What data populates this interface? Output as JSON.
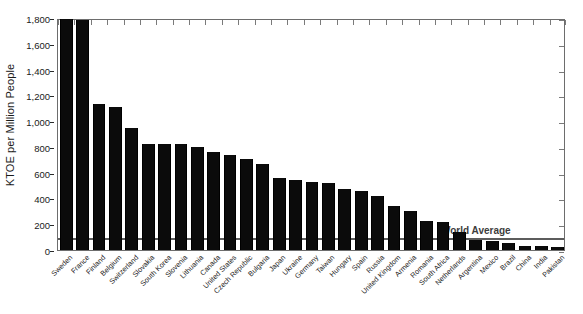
{
  "chart_data": {
    "type": "bar",
    "title": "",
    "xlabel": "",
    "ylabel": "KTOE per Million People",
    "ylim": [
      0,
      1800
    ],
    "ytick_labels": [
      "0",
      "200",
      "400",
      "600",
      "800",
      "1,000",
      "1,200",
      "1,400",
      "1,600",
      "1,800"
    ],
    "ytick_values": [
      0,
      200,
      400,
      600,
      800,
      1000,
      1200,
      1400,
      1600,
      1800
    ],
    "grid": false,
    "legend": "none",
    "bar_color": "#0b0b0b",
    "annotation": {
      "label": "World Average",
      "value": 100,
      "line_color": "#5c5c5c"
    },
    "categories": [
      "Sweden",
      "France",
      "Finland",
      "Belgium",
      "Switzerland",
      "Slovakia",
      "South Korea",
      "Slovenia",
      "Lithuania",
      "Canada",
      "United States",
      "Czech Republic",
      "Bulgaria",
      "Japan",
      "Ukraine",
      "Germany",
      "Taiwan",
      "Hungary",
      "Spain",
      "Russia",
      "United Kingdom",
      "Armenia",
      "Romania",
      "South Africa",
      "Netherlands",
      "Argentina",
      "Mexico",
      "Brazil",
      "China",
      "India",
      "Pakistan"
    ],
    "values": [
      1795,
      1785,
      1130,
      1110,
      945,
      820,
      820,
      820,
      800,
      760,
      740,
      710,
      670,
      555,
      545,
      530,
      520,
      470,
      455,
      420,
      340,
      300,
      225,
      215,
      140,
      75,
      70,
      55,
      35,
      28,
      22
    ]
  }
}
